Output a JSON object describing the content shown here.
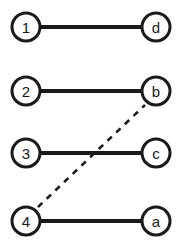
{
  "diagram": {
    "type": "bipartite-matching-graph",
    "title": "",
    "canvas": {
      "width": 185,
      "height": 251,
      "background": "#ffffff"
    },
    "style": {
      "node_fill": "#ffffff",
      "node_stroke": "#1a1a1a",
      "node_radius": 14,
      "node_stroke_width": 3,
      "node_font_size": 15,
      "solid_edge_color": "#1a1a1a",
      "solid_edge_width": 4,
      "dashed_edge_color": "#1a1a1a",
      "dashed_edge_width": 2.6,
      "dash_pattern": "6 6"
    },
    "nodes": [
      {
        "id": "n1",
        "label": "1",
        "cx": 26,
        "cy": 27,
        "column": "left"
      },
      {
        "id": "nd",
        "label": "d",
        "cx": 156,
        "cy": 27,
        "column": "right"
      },
      {
        "id": "n2",
        "label": "2",
        "cx": 26,
        "cy": 91,
        "column": "left"
      },
      {
        "id": "nb",
        "label": "b",
        "cx": 156,
        "cy": 91,
        "column": "right"
      },
      {
        "id": "n3",
        "label": "3",
        "cx": 26,
        "cy": 153,
        "column": "left"
      },
      {
        "id": "nc",
        "label": "c",
        "cx": 156,
        "cy": 153,
        "column": "right"
      },
      {
        "id": "n4",
        "label": "4",
        "cx": 26,
        "cy": 221,
        "column": "left"
      },
      {
        "id": "na",
        "label": "a",
        "cx": 156,
        "cy": 221,
        "column": "right"
      }
    ],
    "edges": [
      {
        "id": "e1",
        "from": "n1",
        "to": "nd",
        "style": "solid",
        "x1": 40,
        "y1": 27,
        "x2": 142,
        "y2": 27
      },
      {
        "id": "e2",
        "from": "n2",
        "to": "nb",
        "style": "solid",
        "x1": 40,
        "y1": 91,
        "x2": 142,
        "y2": 91
      },
      {
        "id": "e3",
        "from": "n3",
        "to": "nc",
        "style": "solid",
        "x1": 40,
        "y1": 153,
        "x2": 142,
        "y2": 153
      },
      {
        "id": "e4",
        "from": "n4",
        "to": "na",
        "style": "solid",
        "x1": 40,
        "y1": 221,
        "x2": 142,
        "y2": 221
      },
      {
        "id": "e5",
        "from": "n4",
        "to": "nb",
        "style": "dashed",
        "x1": 38,
        "y1": 207,
        "x2": 145,
        "y2": 105
      }
    ]
  }
}
